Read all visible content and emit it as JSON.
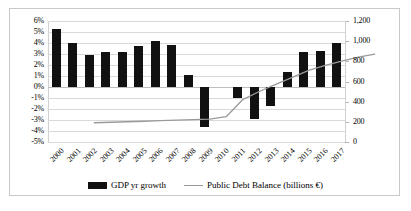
{
  "chart_data": {
    "type": "bar",
    "title": "",
    "subtitle": "",
    "xlabel": "",
    "ylabel": "",
    "categories": [
      "2000",
      "2001",
      "2002",
      "2003",
      "2004",
      "2005",
      "2006",
      "2007",
      "2008",
      "2009",
      "2010",
      "2011",
      "2012",
      "2013",
      "2014",
      "2015",
      "2016",
      "2017"
    ],
    "series": [
      {
        "name": "GDP yr growth",
        "type": "bar",
        "axis": "left",
        "color": "#111111",
        "unit": "%",
        "values": [
          5.3,
          4.0,
          2.9,
          3.2,
          3.2,
          3.7,
          4.2,
          3.8,
          1.1,
          -3.6,
          0.0,
          -1.0,
          -2.9,
          -1.7,
          1.4,
          3.2,
          3.3,
          4.0
        ]
      },
      {
        "name": "Public Debt Balance (billions €)",
        "type": "line",
        "axis": "right",
        "color": "#9a9a9a",
        "unit": "billions €",
        "values": [
          310,
          315,
          320,
          325,
          330,
          335,
          340,
          345,
          370,
          540,
          620,
          690,
          760,
          830,
          880,
          920,
          960,
          990
        ]
      }
    ],
    "left_axis": {
      "ticks": [
        "6%",
        "5%",
        "4%",
        "3%",
        "2%",
        "1%",
        "0%",
        "-1%",
        "-2%",
        "-3%",
        "-4%",
        "-5%"
      ],
      "values": [
        6,
        5,
        4,
        3,
        2,
        1,
        0,
        -1,
        -2,
        -3,
        -4,
        -5
      ],
      "min": -5,
      "max": 6,
      "step": 1
    },
    "right_axis": {
      "ticks": [
        "1,200",
        "1,000",
        "800",
        "600",
        "400",
        "200",
        "0"
      ],
      "values": [
        1200,
        1000,
        800,
        600,
        400,
        200,
        0
      ],
      "min": 0,
      "max": 1200,
      "step": 200
    },
    "grid": true,
    "legend_position": "bottom",
    "legend": [
      "GDP yr growth",
      "Public Debt Balance (billions €)"
    ]
  },
  "legend": {
    "bar_label": "GDP yr growth",
    "line_label": "Public Debt Balance (billions €)"
  }
}
